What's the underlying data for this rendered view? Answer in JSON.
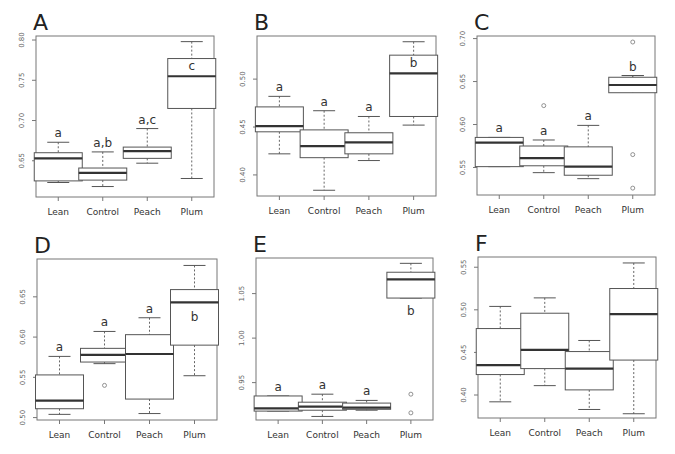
{
  "figure": {
    "categories": [
      "Lean",
      "Control",
      "Peach",
      "Plum"
    ],
    "colors": {
      "box_stroke": "#555555",
      "median": "#333333",
      "axis": "#777777",
      "text": "#333333",
      "background": "#ffffff"
    }
  },
  "chart_data": [
    {
      "panel": "A",
      "type": "box",
      "categories": [
        "Lean",
        "Control",
        "Peach",
        "Plum"
      ],
      "ylim": [
        0.605,
        0.805
      ],
      "yticks": [
        0.65,
        0.7,
        0.75,
        0.8
      ],
      "ytick_labels": [
        "0.65",
        "0.70",
        "0.75",
        "0.80"
      ],
      "series": [
        {
          "name": "Lean",
          "whisker_low": 0.623,
          "q1": 0.625,
          "median": 0.653,
          "q3": 0.66,
          "whisker_high": 0.673,
          "outliers": [],
          "label": "a"
        },
        {
          "name": "Control",
          "whisker_low": 0.618,
          "q1": 0.626,
          "median": 0.635,
          "q3": 0.641,
          "whisker_high": 0.661,
          "outliers": [],
          "label": "a,b"
        },
        {
          "name": "Peach",
          "whisker_low": 0.647,
          "q1": 0.653,
          "median": 0.662,
          "q3": 0.667,
          "whisker_high": 0.69,
          "outliers": [],
          "label": "a,c"
        },
        {
          "name": "Plum",
          "whisker_low": 0.628,
          "q1": 0.715,
          "median": 0.755,
          "q3": 0.777,
          "whisker_high": 0.798,
          "outliers": [],
          "label": "c"
        }
      ],
      "geom": {
        "x0": 36,
        "y0": 36,
        "w": 178,
        "h": 161,
        "left": 0,
        "top": 0
      }
    },
    {
      "panel": "B",
      "type": "box",
      "categories": [
        "Lean",
        "Control",
        "Peach",
        "Plum"
      ],
      "ylim": [
        0.378,
        0.545
      ],
      "yticks": [
        0.4,
        0.45,
        0.5
      ],
      "ytick_labels": [
        "0.40",
        "0.45",
        "0.50"
      ],
      "series": [
        {
          "name": "Lean",
          "whisker_low": 0.422,
          "q1": 0.445,
          "median": 0.451,
          "q3": 0.471,
          "whisker_high": 0.482,
          "outliers": [],
          "label": "a"
        },
        {
          "name": "Control",
          "whisker_low": 0.384,
          "q1": 0.418,
          "median": 0.43,
          "q3": 0.447,
          "whisker_high": 0.467,
          "outliers": [],
          "label": "a"
        },
        {
          "name": "Peach",
          "whisker_low": 0.415,
          "q1": 0.422,
          "median": 0.434,
          "q3": 0.444,
          "whisker_high": 0.461,
          "outliers": [],
          "label": "a"
        },
        {
          "name": "Plum",
          "whisker_low": 0.452,
          "q1": 0.461,
          "median": 0.506,
          "q3": 0.525,
          "whisker_high": 0.539,
          "outliers": [],
          "label": "b"
        }
      ],
      "geom": {
        "x0": 32,
        "y0": 36,
        "w": 179,
        "h": 160,
        "left": 225,
        "top": 0
      }
    },
    {
      "panel": "C",
      "type": "box",
      "categories": [
        "Lean",
        "Control",
        "Peach",
        "Plum"
      ],
      "ylim": [
        0.518,
        0.703
      ],
      "yticks": [
        0.55,
        0.6,
        0.65,
        0.7
      ],
      "ytick_labels": [
        "0.55",
        "0.60",
        "0.65",
        "0.70"
      ],
      "series": [
        {
          "name": "Lean",
          "whisker_low": 0.551,
          "q1": 0.551,
          "median": 0.579,
          "q3": 0.585,
          "whisker_high": 0.585,
          "outliers": [],
          "label": "a"
        },
        {
          "name": "Control",
          "whisker_low": 0.544,
          "q1": 0.552,
          "median": 0.561,
          "q3": 0.575,
          "whisker_high": 0.582,
          "outliers": [
            0.622
          ],
          "label": "a"
        },
        {
          "name": "Peach",
          "whisker_low": 0.537,
          "q1": 0.541,
          "median": 0.551,
          "q3": 0.574,
          "whisker_high": 0.599,
          "outliers": [],
          "label": "a"
        },
        {
          "name": "Plum",
          "whisker_low": 0.657,
          "q1": 0.637,
          "median": 0.646,
          "q3": 0.655,
          "whisker_high": 0.657,
          "outliers": [
            0.696,
            0.565,
            0.526
          ],
          "label": "b"
        }
      ],
      "geom": {
        "x0": 27,
        "y0": 36,
        "w": 178,
        "h": 159,
        "left": 450,
        "top": 0
      }
    },
    {
      "panel": "D",
      "type": "box",
      "categories": [
        "Lean",
        "Control",
        "Peach",
        "Plum"
      ],
      "ylim": [
        0.497,
        0.697
      ],
      "yticks": [
        0.5,
        0.55,
        0.6,
        0.65
      ],
      "ytick_labels": [
        "0.50",
        "0.55",
        "0.60",
        "0.65"
      ],
      "series": [
        {
          "name": "Lean",
          "whisker_low": 0.504,
          "q1": 0.511,
          "median": 0.521,
          "q3": 0.553,
          "whisker_high": 0.576,
          "outliers": [],
          "label": "a"
        },
        {
          "name": "Control",
          "whisker_low": 0.567,
          "q1": 0.569,
          "median": 0.578,
          "q3": 0.586,
          "whisker_high": 0.607,
          "outliers": [
            0.54
          ],
          "label": "a"
        },
        {
          "name": "Peach",
          "whisker_low": 0.505,
          "q1": 0.523,
          "median": 0.579,
          "q3": 0.603,
          "whisker_high": 0.624,
          "outliers": [],
          "label": "a"
        },
        {
          "name": "Plum",
          "whisker_low": 0.552,
          "q1": 0.59,
          "median": 0.643,
          "q3": 0.659,
          "whisker_high": 0.689,
          "outliers": [],
          "label": "b"
        }
      ],
      "geom": {
        "x0": 37,
        "y0": 32,
        "w": 180,
        "h": 161,
        "left": 0,
        "top": 227
      }
    },
    {
      "panel": "E",
      "type": "box",
      "categories": [
        "Lean",
        "Control",
        "Peach",
        "Plum"
      ],
      "ylim": [
        0.908,
        1.09
      ],
      "yticks": [
        0.95,
        1.0,
        1.05
      ],
      "ytick_labels": [
        "0.95",
        "1.00",
        "1.05"
      ],
      "series": [
        {
          "name": "Lean",
          "whisker_low": 0.918,
          "q1": 0.918,
          "median": 0.921,
          "q3": 0.935,
          "whisker_high": 0.935,
          "outliers": [],
          "label": "a"
        },
        {
          "name": "Control",
          "whisker_low": 0.912,
          "q1": 0.919,
          "median": 0.923,
          "q3": 0.928,
          "whisker_high": 0.937,
          "outliers": [],
          "label": "a"
        },
        {
          "name": "Peach",
          "whisker_low": 0.919,
          "q1": 0.92,
          "median": 0.922,
          "q3": 0.927,
          "whisker_high": 0.93,
          "outliers": [],
          "label": "a"
        },
        {
          "name": "Plum",
          "whisker_low": 1.045,
          "q1": 1.045,
          "median": 1.066,
          "q3": 1.074,
          "whisker_high": 1.084,
          "outliers": [
            0.937,
            0.916
          ],
          "label": "b"
        }
      ],
      "geom": {
        "x0": 31,
        "y0": 31,
        "w": 177,
        "h": 162,
        "left": 225,
        "top": 227
      }
    },
    {
      "panel": "F",
      "type": "box",
      "categories": [
        "Lean",
        "Control",
        "Peach",
        "Plum"
      ],
      "ylim": [
        0.373,
        0.562
      ],
      "yticks": [
        0.4,
        0.45,
        0.5,
        0.55
      ],
      "ytick_labels": [
        "0.40",
        "0.45",
        "0.50",
        "0.55"
      ],
      "series": [
        {
          "name": "Lean",
          "whisker_low": 0.392,
          "q1": 0.424,
          "median": 0.435,
          "q3": 0.478,
          "whisker_high": 0.504,
          "outliers": [],
          "label": ""
        },
        {
          "name": "Control",
          "whisker_low": 0.411,
          "q1": 0.431,
          "median": 0.453,
          "q3": 0.496,
          "whisker_high": 0.514,
          "outliers": [],
          "label": ""
        },
        {
          "name": "Peach",
          "whisker_low": 0.383,
          "q1": 0.406,
          "median": 0.431,
          "q3": 0.451,
          "whisker_high": 0.464,
          "outliers": [],
          "label": ""
        },
        {
          "name": "Plum",
          "whisker_low": 0.378,
          "q1": 0.441,
          "median": 0.495,
          "q3": 0.525,
          "whisker_high": 0.555,
          "outliers": [],
          "label": ""
        }
      ],
      "geom": {
        "x0": 28,
        "y0": 30,
        "w": 178,
        "h": 161,
        "left": 450,
        "top": 227
      }
    }
  ]
}
